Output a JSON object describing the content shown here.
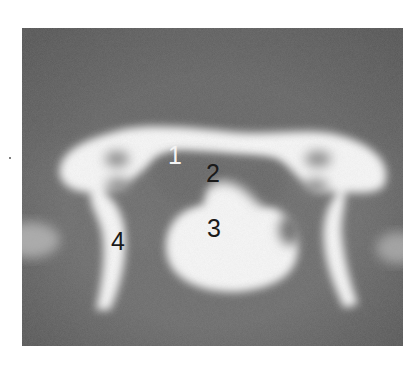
{
  "figure": {
    "type": "ct-scan-vertebra",
    "colors": {
      "background": "#6a6a6a",
      "vignette": "#575757",
      "bone": "#f7f7f7",
      "soft_tissue_dark": "#5e5e5e",
      "page": "#ffffff"
    },
    "labels": [
      {
        "id": "1",
        "text": "1",
        "color": "white",
        "x": 175,
        "y": 155
      },
      {
        "id": "2",
        "text": "2",
        "color": "black",
        "x": 213,
        "y": 173
      },
      {
        "id": "3",
        "text": "3",
        "color": "black",
        "x": 214,
        "y": 228
      },
      {
        "id": "4",
        "text": "4",
        "color": "black",
        "x": 118,
        "y": 241
      }
    ]
  }
}
